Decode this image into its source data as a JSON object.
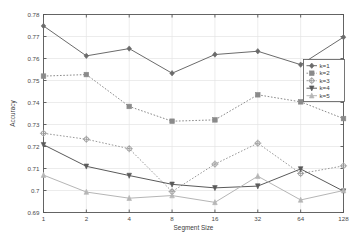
{
  "chart_data": {
    "type": "line",
    "title": "",
    "xlabel": "Segment Size",
    "ylabel": "Accuracy",
    "x_categories": [
      "1",
      "2",
      "4",
      "8",
      "16",
      "32",
      "64",
      "128"
    ],
    "x_tick_labels": [
      "1",
      "2",
      "4",
      "8",
      "16",
      "32",
      "64",
      "128"
    ],
    "y_tick_labels": [
      "0.69",
      "0.7",
      "0.71",
      "0.72",
      "0.73",
      "0.74",
      "0.75",
      "0.76",
      "0.77",
      "0.78"
    ],
    "ylim": [
      0.69,
      0.78
    ],
    "xscale": "log2-categorical",
    "grid": true,
    "legend_position": "right",
    "series": [
      {
        "name": "k=1",
        "values": [
          0.7748,
          0.7612,
          0.7645,
          0.7533,
          0.7618,
          0.7633,
          0.7572,
          0.7697
        ],
        "color": "#6b6b6b",
        "linestyle": "solid",
        "marker": "diamond"
      },
      {
        "name": "k=2",
        "values": [
          0.752,
          0.7527,
          0.7382,
          0.7315,
          0.7321,
          0.7435,
          0.7403,
          0.7327
        ],
        "color": "#8a8a8a",
        "linestyle": "dotted",
        "marker": "square"
      },
      {
        "name": "k=3",
        "values": [
          0.726,
          0.7233,
          0.719,
          0.6995,
          0.712,
          0.7215,
          0.7077,
          0.7112
        ],
        "color": "#9a9a9a",
        "linestyle": "dotted",
        "marker": "circle"
      },
      {
        "name": "k=4",
        "values": [
          0.7208,
          0.711,
          0.7068,
          0.7028,
          0.7012,
          0.702,
          0.7098,
          0.6997
        ],
        "color": "#5a5a5a",
        "linestyle": "solid",
        "marker": "triangle-down"
      },
      {
        "name": "k=5",
        "values": [
          0.707,
          0.6993,
          0.6965,
          0.6977,
          0.6946,
          0.7065,
          0.6957,
          0.7
        ],
        "color": "#b6b6b6",
        "linestyle": "solid",
        "marker": "triangle-up"
      }
    ]
  },
  "legend": {
    "entries": [
      "k=1",
      "k=2",
      "k=3",
      "k=4",
      "k=5"
    ]
  },
  "axes": {
    "xlabel": "Segment Size",
    "ylabel": "Accuracy"
  },
  "colors": {
    "background": "#ffffff",
    "axis": "#555555",
    "grid": "#e4e4e4",
    "text": "#3c3c3c"
  }
}
